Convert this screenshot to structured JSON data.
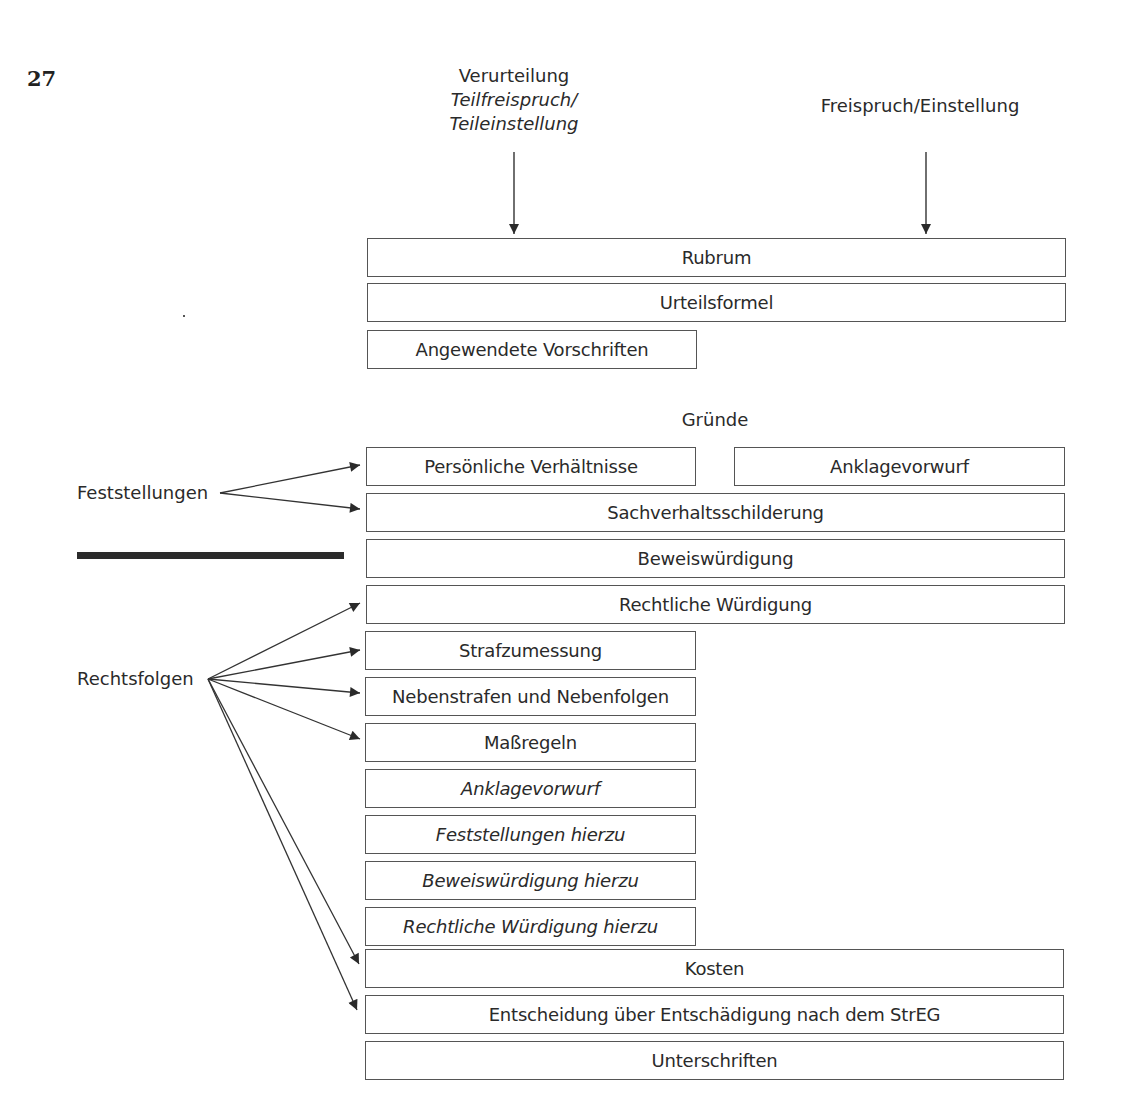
{
  "page": {
    "number": "27"
  },
  "header_labels": {
    "left": {
      "line1": "Verurteilung",
      "line2": "Teilfreispruch/",
      "line3": "Teileinstellung"
    },
    "right": "Freispruch/Einstellung"
  },
  "sections": {
    "gruende": "Gründe"
  },
  "side_labels": {
    "feststellungen": "Feststellungen",
    "rechtsfolgen": "Rechtsfolgen"
  },
  "boxes": {
    "rubrum": "Rubrum",
    "urteilsformel": "Urteilsformel",
    "angewendete_vorschriften": "Angewendete Vorschriften",
    "persoenliche_verhaeltnisse": "Persönliche Verhältnisse",
    "anklagevorwurf_top": "Anklagevorwurf",
    "sachverhaltsschilderung": "Sachverhaltsschilderung",
    "beweiswuerdigung": "Beweiswürdigung",
    "rechtliche_wuerdigung": "Rechtliche Würdigung",
    "strafzumessung": "Strafzumessung",
    "nebenstrafen": "Nebenstrafen und Nebenfolgen",
    "massregeln": "Maßregeln",
    "anklagevorwurf_italic": "Anklagevorwurf",
    "feststellungen_hierzu": "Feststellungen hierzu",
    "beweiswuerdigung_hierzu": "Beweiswürdigung hierzu",
    "rechtliche_wuerdigung_hierzu": "Rechtliche Würdigung hierzu",
    "kosten": "Kosten",
    "entscheidung_streg": "Entscheidung über Entschädigung nach dem StrEG",
    "unterschriften": "Unterschriften"
  },
  "colors": {
    "text": "#2a2a2a",
    "border": "#555555",
    "bar": "#2b2b2b",
    "background": "#ffffff"
  }
}
